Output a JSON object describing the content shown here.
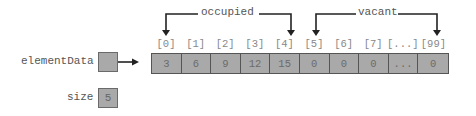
{
  "pointer": {
    "label": "elementData"
  },
  "size": {
    "label": "size",
    "value": "5"
  },
  "array": {
    "indices": [
      "[0]",
      "[1]",
      "[2]",
      "[3]",
      "[4]",
      "[5]",
      "[6]",
      "[7]",
      "[...]",
      "[99]"
    ],
    "values": [
      "3",
      "6",
      "9",
      "12",
      "15",
      "0",
      "0",
      "0",
      "...",
      "0"
    ]
  },
  "brackets": {
    "occupied": "occupied",
    "vacant": "vacant"
  },
  "colors": {
    "cell_fill": "#a9a9a9",
    "line": "#222222",
    "text": "#555555"
  }
}
